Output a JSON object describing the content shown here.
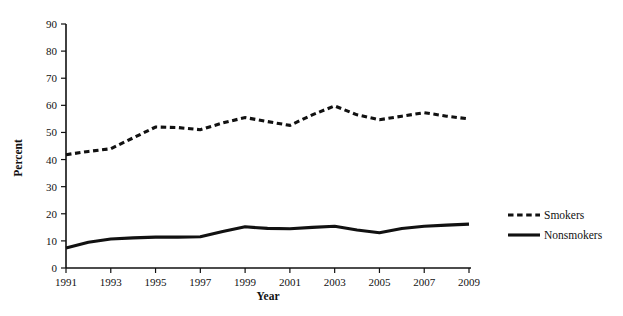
{
  "chart_data": {
    "type": "line",
    "title": "",
    "xlabel": "Year",
    "ylabel": "Percent",
    "x": [
      1991,
      1992,
      1993,
      1994,
      1995,
      1996,
      1997,
      1998,
      1999,
      2000,
      2001,
      2002,
      2003,
      2004,
      2005,
      2006,
      2007,
      2008,
      2009
    ],
    "xlim": [
      1991,
      2009
    ],
    "ylim": [
      0,
      90
    ],
    "ytick_values": [
      0,
      10,
      20,
      30,
      40,
      50,
      60,
      70,
      80,
      90
    ],
    "ytick_labels": [
      "0",
      "10",
      "20",
      "30",
      "40",
      "50",
      "60",
      "70",
      "80",
      "90"
    ],
    "xtick_values": [
      1991,
      1993,
      1995,
      1997,
      1999,
      2001,
      2003,
      2005,
      2007,
      2009
    ],
    "xtick_labels": [
      "1991",
      "1993",
      "1995",
      "1997",
      "1999",
      "2001",
      "2003",
      "2005",
      "2007",
      "2009"
    ],
    "grid": false,
    "legend_position": "right",
    "series": [
      {
        "name": "Smokers",
        "style": "dashed",
        "color": "#111111",
        "values": [
          41.8,
          43.0,
          44.0,
          48.0,
          52.0,
          51.8,
          51.0,
          53.5,
          55.5,
          54.0,
          52.6,
          56.5,
          59.8,
          56.5,
          54.7,
          56.0,
          57.3,
          56.0,
          55.0
        ]
      },
      {
        "name": "Nonsmokers",
        "style": "solid",
        "color": "#111111",
        "values": [
          7.4,
          9.5,
          10.7,
          11.1,
          11.4,
          11.4,
          11.5,
          13.5,
          15.2,
          14.6,
          14.5,
          15.0,
          15.4,
          14.0,
          13.0,
          14.6,
          15.4,
          15.8,
          16.2
        ]
      }
    ]
  },
  "legend": {
    "items": [
      {
        "label": "Smokers",
        "style": "dashed"
      },
      {
        "label": "Nonsmokers",
        "style": "solid"
      }
    ]
  }
}
